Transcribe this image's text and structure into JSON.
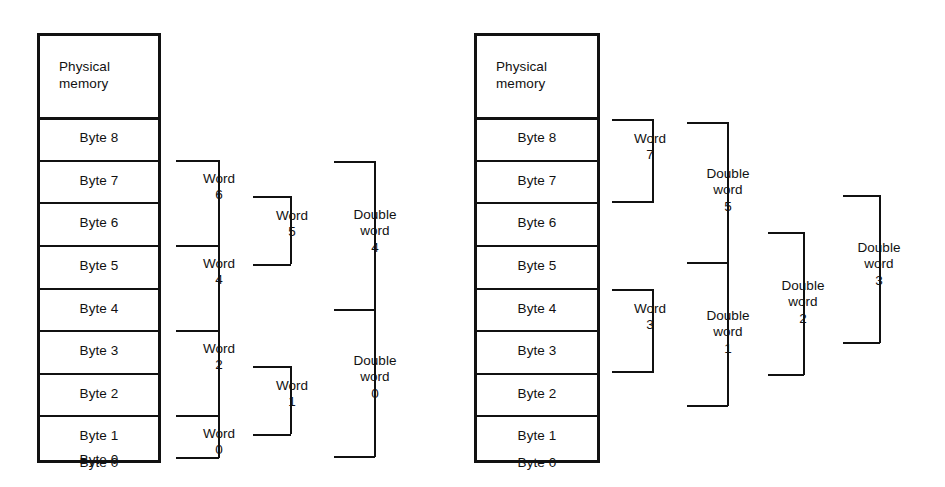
{
  "figure": {
    "background_color": "#ffffff",
    "ink_color": "#111111"
  },
  "diagrams": [
    {
      "id": "left",
      "name": "unaligned-access-diagram",
      "memory": {
        "header": "Physical\nmemory",
        "cells": [
          "Byte 8",
          "Byte 7",
          "Byte 6",
          "Byte 5",
          "Byte 4",
          "Byte 3",
          "Byte 2",
          "Byte 1",
          "Byte 0"
        ]
      },
      "brackets": [
        {
          "label": "Word\n6",
          "spans": [
            "Byte 7",
            "Byte 6"
          ],
          "column": 1
        },
        {
          "label": "Word\n4",
          "spans": [
            "Byte 5",
            "Byte 4"
          ],
          "column": 1
        },
        {
          "label": "Word\n2",
          "spans": [
            "Byte 3",
            "Byte 2"
          ],
          "column": 1
        },
        {
          "label": "Word\n0",
          "spans": [
            "Byte 1",
            "Byte 0"
          ],
          "column": 1
        },
        {
          "label": "Word\n5",
          "spans": [
            "Word 6",
            "Word 4"
          ],
          "column": 2
        },
        {
          "label": "Word\n1",
          "spans": [
            "Word 2",
            "Word 0"
          ],
          "column": 2
        },
        {
          "label": "Double\nword\n4",
          "spans": [
            "Word 6",
            "Word 2"
          ],
          "column": 3
        },
        {
          "label": "Double\nword\n0",
          "spans": [
            "Word 2",
            "Word 0"
          ],
          "column": 3
        }
      ]
    },
    {
      "id": "right",
      "name": "aligned-access-diagram",
      "memory": {
        "header": "Physical\nmemory",
        "cells": [
          "Byte 8",
          "Byte 7",
          "Byte 6",
          "Byte 5",
          "Byte 4",
          "Byte 3",
          "Byte 2",
          "Byte 1",
          "Byte 0"
        ]
      },
      "brackets": [
        {
          "label": "Word\n7",
          "spans": [
            "Byte 8",
            "Byte 7"
          ],
          "column": 1
        },
        {
          "label": "Word\n3",
          "spans": [
            "Byte 4",
            "Byte 3"
          ],
          "column": 1
        },
        {
          "label": "Double\nword\n5",
          "spans": [
            "Byte 8",
            "Byte 5"
          ],
          "column": 2
        },
        {
          "label": "Double\nword\n1",
          "spans": [
            "Byte 4",
            "Byte 1"
          ],
          "column": 2
        },
        {
          "label": "Double\nword\n2",
          "spans": [
            "Byte 7",
            "Byte 4"
          ],
          "column": 3
        },
        {
          "label": "Double\nword\n3",
          "spans": [
            "Byte 6",
            "Byte 3"
          ],
          "column": 4
        }
      ]
    }
  ],
  "labels": {
    "left": {
      "header": "Physical\nmemory",
      "byte8": "Byte 8",
      "byte7": "Byte 7",
      "byte6": "Byte 6",
      "byte5": "Byte 5",
      "byte4": "Byte 4",
      "byte3": "Byte 3",
      "byte2": "Byte 2",
      "byte1": "Byte 1",
      "byte0": "Byte 0",
      "word6": "Word\n6",
      "word4": "Word\n4",
      "word2": "Word\n2",
      "word0": "Word\n0",
      "word5": "Word\n5",
      "word1": "Word\n1",
      "dword4": "Double\nword\n4",
      "dword0": "Double\nword\n0"
    },
    "right": {
      "header": "Physical\nmemory",
      "byte8": "Byte 8",
      "byte7": "Byte 7",
      "byte6": "Byte 6",
      "byte5": "Byte 5",
      "byte4": "Byte 4",
      "byte3": "Byte 3",
      "byte2": "Byte 2",
      "byte1": "Byte 1",
      "byte0": "Byte 0",
      "word7": "Word\n7",
      "word3": "Word\n3",
      "dword5": "Double\nword\n5",
      "dword1": "Double\nword\n1",
      "dword2": "Double\nword\n2",
      "dword3": "Double\nword\n3"
    }
  }
}
